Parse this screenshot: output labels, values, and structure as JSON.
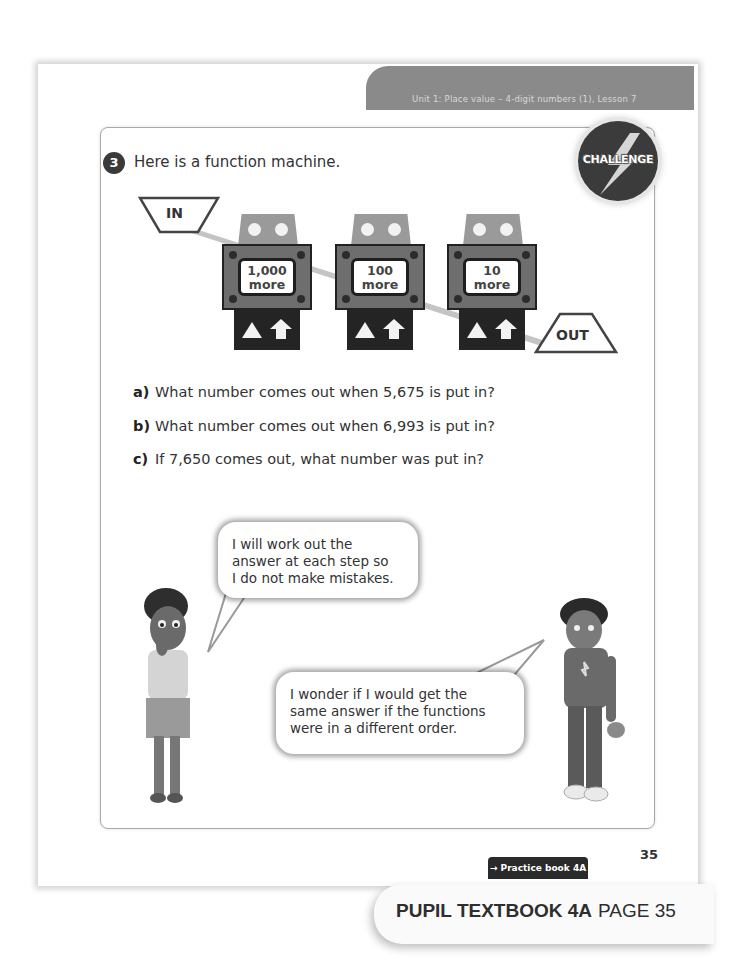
{
  "header": {
    "unit_label": "Unit 1: Place value – 4-digit numbers (1), Lesson 7"
  },
  "question": {
    "number": "3",
    "intro": "Here is a function machine.",
    "badge": "CHALLENGE",
    "machine": {
      "input_label": "IN",
      "output_label": "OUT",
      "steps": [
        {
          "line1": "1,000",
          "line2": "more"
        },
        {
          "line1": "100",
          "line2": "more"
        },
        {
          "line1": "10",
          "line2": "more"
        }
      ]
    },
    "parts": [
      {
        "label": "a)",
        "text": "What number comes out when 5,675 is put in?"
      },
      {
        "label": "b)",
        "text": "What number comes out when 6,993 is put in?"
      },
      {
        "label": "c)",
        "text": "If 7,650 comes out, what number was put in?"
      }
    ]
  },
  "speech": {
    "girl": [
      "I will work out the",
      "answer at each step so",
      "I do not make mistakes."
    ],
    "boy": [
      "I wonder if I would get the",
      "same answer if the functions",
      "were in a different order."
    ]
  },
  "footer": {
    "page_number": "35",
    "practice_link": "→ Practice book 4A p24",
    "book_title": "PUPIL TEXTBOOK 4A",
    "book_page": "PAGE 35"
  }
}
